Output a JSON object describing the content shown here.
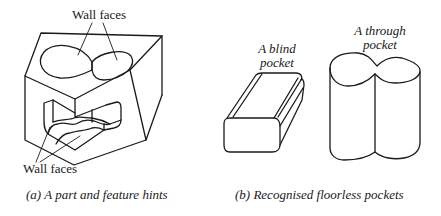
{
  "figure_a": {
    "top_label": "Wall faces",
    "bottom_label": "Wall faces",
    "caption": "(a) A part and feature hints"
  },
  "figure_b": {
    "blind_label_line1": "A blind",
    "blind_label_line2": "pocket",
    "through_label_line1": "A through",
    "through_label_line2": "pocket",
    "caption": "(b) Recognised floorless pockets"
  },
  "colors": {
    "line": "#1a1a1a",
    "background": "#ffffff"
  }
}
